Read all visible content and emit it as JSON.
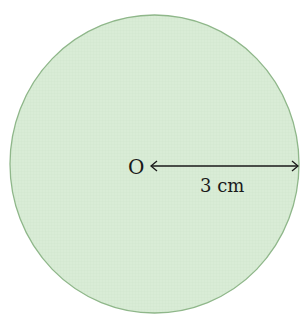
{
  "diagram": {
    "shape": "circle",
    "fill_color": "#d9ecd6",
    "stroke_color": "#8fb78a",
    "center_label": "O",
    "radius_label": "3 cm",
    "arrow_color": "#1a1a1a"
  }
}
